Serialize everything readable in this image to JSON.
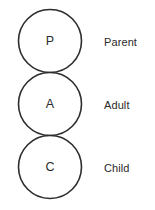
{
  "diagram": {
    "background_color": "#ffffff",
    "stroke_color": "#2d2d2d",
    "text_color": "#2a2a2a",
    "states": [
      {
        "letter": "P",
        "label": "Parent",
        "cx": 50,
        "cy": 41,
        "r": 31.5
      },
      {
        "letter": "A",
        "label": "Adult",
        "cx": 50,
        "cy": 104,
        "r": 31.5
      },
      {
        "letter": "C",
        "label": "Child",
        "cx": 50,
        "cy": 167,
        "r": 31.5
      }
    ]
  }
}
